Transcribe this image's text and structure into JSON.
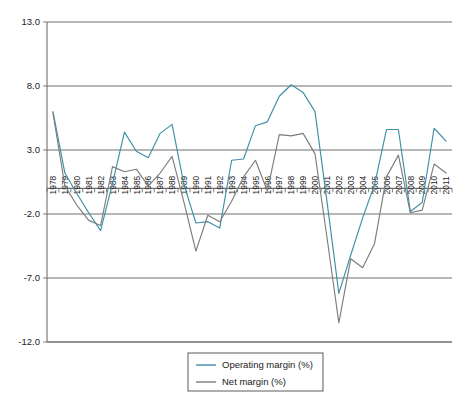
{
  "chart_data": {
    "type": "line",
    "title": "",
    "subtitle": "",
    "xlabel": "",
    "ylabel": "",
    "grid": true,
    "legend_position": "bottom-center",
    "ylim": [
      -12.0,
      13.0
    ],
    "y_ticks": [
      "13.0",
      "8.0",
      "3.0",
      "-2.0",
      "-7.0",
      "-12.0"
    ],
    "y_tick_values": [
      13.0,
      8.0,
      3.0,
      -2.0,
      -7.0,
      -12.0
    ],
    "categories": [
      "1978",
      "1979",
      "1980",
      "1981",
      "1982",
      "1983",
      "1984",
      "1985",
      "1986",
      "1987",
      "1988",
      "1989",
      "1990",
      "1991",
      "1992",
      "1993",
      "1994",
      "1995",
      "1996",
      "1997",
      "1998",
      "1999",
      "2000",
      "2001",
      "2002",
      "2003",
      "2004",
      "2005",
      "2006",
      "2007",
      "2008",
      "2009",
      "2010",
      "2011"
    ],
    "series": [
      {
        "name": "Operating margin (%)",
        "color": "#3d8fa8",
        "values": [
          6.0,
          1.2,
          -0.4,
          -1.9,
          -3.3,
          0.4,
          4.4,
          2.9,
          2.4,
          4.3,
          5.0,
          0.3,
          -2.7,
          -2.6,
          -3.1,
          2.2,
          2.3,
          4.9,
          5.2,
          7.2,
          8.1,
          7.5,
          6.0,
          -1.0,
          -8.2,
          -5.2,
          -2.3,
          0.3,
          4.6,
          4.6,
          -1.8,
          -1.1,
          4.7,
          3.7
        ]
      },
      {
        "name": "Net margin (%)",
        "color": "#7d7d7d",
        "values": [
          5.9,
          0.2,
          -1.3,
          -2.5,
          -2.9,
          1.7,
          1.3,
          1.5,
          0.2,
          1.2,
          2.5,
          -1.1,
          -4.9,
          -2.1,
          -2.6,
          -1.0,
          0.9,
          2.2,
          -0.2,
          4.2,
          4.1,
          4.3,
          2.7,
          -3.8,
          -10.5,
          -5.5,
          -6.2,
          -4.3,
          0.9,
          2.6,
          -1.9,
          -1.7,
          1.9,
          1.2
        ]
      }
    ],
    "legend": [
      {
        "label": "Operating margin (%)",
        "color": "#3d8fa8"
      },
      {
        "label": "Net margin (%)",
        "color": "#7d7d7d"
      }
    ]
  },
  "plot_geometry": {
    "left": 47,
    "right": 452,
    "top": 22,
    "bottom": 342
  }
}
